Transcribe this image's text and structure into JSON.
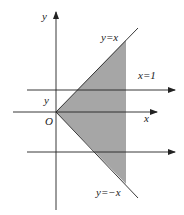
{
  "diagram": {
    "type": "coordinate-plane-region",
    "labels": {
      "y_axis": "y",
      "x_axis": "x",
      "origin": "O",
      "line_upper": "y=x",
      "line_lower": "y=−x",
      "vertical_line": "x=1",
      "inner_y": "y"
    },
    "colors": {
      "shade": "#a6a6a6",
      "line": "#222222"
    }
  }
}
